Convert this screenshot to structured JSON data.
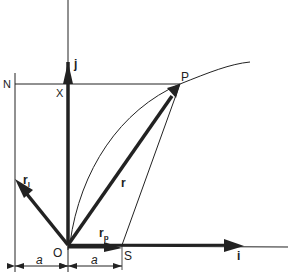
{
  "diagram": {
    "type": "vector-geometry",
    "colors": {
      "ink": "#222222",
      "background": "#ffffff"
    },
    "points": {
      "O": {
        "label": "O",
        "x": 68,
        "y": 245
      },
      "P": {
        "label": "P",
        "x": 180,
        "y": 84
      },
      "S": {
        "label": "S",
        "x": 122,
        "y": 245
      },
      "X": {
        "label": "X",
        "x": 68,
        "y": 84
      },
      "N": {
        "label": "N",
        "x": 15,
        "y": 84
      }
    },
    "vectors": {
      "i": {
        "label": "i"
      },
      "j": {
        "label": "j"
      },
      "r": {
        "label": "r"
      },
      "rl": {
        "label": "r",
        "subscript": "l"
      },
      "rp": {
        "label": "r",
        "subscript": "p"
      }
    },
    "dimensions": {
      "left": {
        "label": "a"
      },
      "right": {
        "label": "a"
      }
    }
  }
}
